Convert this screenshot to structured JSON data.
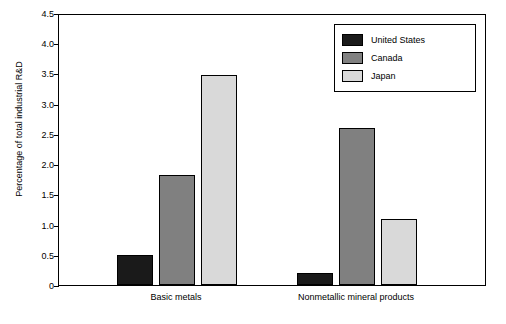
{
  "chart_data": {
    "type": "bar",
    "title": "",
    "xlabel": "",
    "ylabel": "Percentage of total industrial R&D",
    "categories": [
      "Basic metals",
      "Nonmetallic mineral products"
    ],
    "series": [
      {
        "name": "United States",
        "values": [
          0.5,
          0.2
        ],
        "color": "#1a1a1a"
      },
      {
        "name": "Canada",
        "values": [
          1.82,
          2.6
        ],
        "color": "#808080"
      },
      {
        "name": "Japan",
        "values": [
          3.48,
          1.1
        ],
        "color": "#d9d9d9"
      }
    ],
    "ylim": [
      0,
      4.5
    ],
    "yticks": [
      "0",
      "0.5",
      "1.0",
      "1.5",
      "2.0",
      "2.5",
      "3.0",
      "3.5",
      "4.0",
      "4.5"
    ],
    "grid": false,
    "legend_position": "top-right"
  },
  "legend": {
    "items": [
      {
        "label": "United States",
        "color": "#1a1a1a"
      },
      {
        "label": "Canada",
        "color": "#808080"
      },
      {
        "label": "Japan",
        "color": "#d9d9d9"
      }
    ]
  },
  "axes": {
    "y_title": "Percentage of total industrial R&D",
    "y_ticks": [
      "0",
      "0.5",
      "1.0",
      "1.5",
      "2.0",
      "2.5",
      "3.0",
      "3.5",
      "4.0",
      "4.5"
    ],
    "x_labels": [
      "Basic metals",
      "Nonmetallic mineral products"
    ]
  }
}
